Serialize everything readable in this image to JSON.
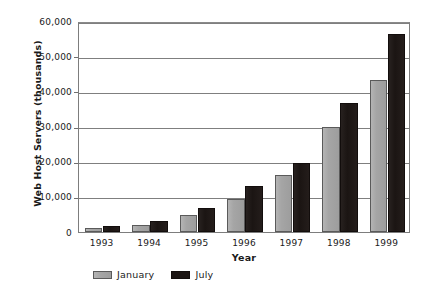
{
  "chart_data": {
    "type": "bar",
    "title": "",
    "xlabel": "Year",
    "ylabel": "Web Host Servers (thousands)",
    "categories": [
      "1993",
      "1994",
      "1995",
      "1996",
      "1997",
      "1998",
      "1999"
    ],
    "series": [
      {
        "name": "January",
        "color": "#a5a5a5",
        "values": [
          1200,
          2100,
          4800,
          9500,
          16300,
          29900,
          43200
        ]
      },
      {
        "name": "July",
        "color": "#1b1513",
        "values": [
          1700,
          3200,
          6700,
          13000,
          19600,
          36800,
          56400
        ]
      }
    ],
    "ylim": [
      0,
      60000
    ],
    "ytick_values": [
      0,
      10000,
      20000,
      30000,
      40000,
      50000,
      60000
    ],
    "ytick_labels": [
      "0",
      "10,000",
      "20,000",
      "30,000",
      "40,000",
      "50,000",
      "60,000"
    ],
    "grid": true,
    "legend_position": "bottom-left"
  },
  "legend": {
    "items": [
      {
        "label": "January",
        "swatch": "january-swatch"
      },
      {
        "label": "July",
        "swatch": "july-swatch"
      }
    ]
  }
}
